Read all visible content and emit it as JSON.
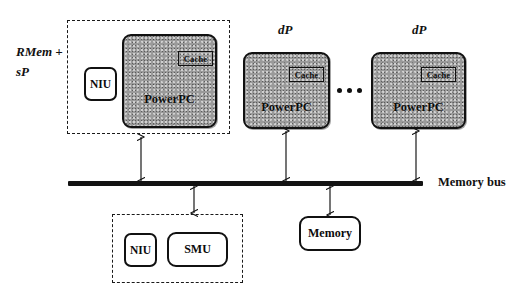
{
  "diagram": {
    "bus": {
      "label": "Memory bus"
    },
    "groups": [
      {
        "id": "rmem-sp",
        "label_line1": "RMem +",
        "label_line2": "sP"
      },
      {
        "id": "niu-smu",
        "label": ""
      }
    ],
    "processors": [
      {
        "id": "p0",
        "tag": "",
        "name": "PowerPC",
        "cache": "Cache"
      },
      {
        "id": "p1",
        "tag": "dP",
        "name": "PowerPC",
        "cache": "Cache"
      },
      {
        "id": "p2",
        "tag": "dP",
        "name": "PowerPC",
        "cache": "Cache"
      }
    ],
    "units": [
      {
        "id": "niu-top",
        "label": "NIU"
      },
      {
        "id": "niu-bottom",
        "label": "NIU"
      },
      {
        "id": "smu",
        "label": "SMU"
      },
      {
        "id": "memory",
        "label": "Memory"
      }
    ],
    "ellipsis": "•••",
    "colors": {
      "ink": "#111111",
      "cpu_fill": "#9a9a9a",
      "paper": "#ffffff"
    }
  }
}
